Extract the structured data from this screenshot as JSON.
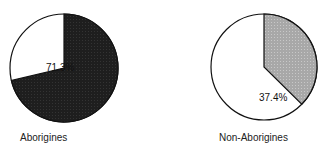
{
  "chart_data": [
    {
      "type": "pie",
      "title": "Aborigines",
      "categories": [
        "Shaded",
        "Unshaded"
      ],
      "values": [
        71.3,
        28.7
      ],
      "annotations": [
        "71.3%"
      ],
      "colors": [
        "#1c1c1c",
        "#ffffff"
      ]
    },
    {
      "type": "pie",
      "title": "Non-Aborigines",
      "categories": [
        "Shaded",
        "Unshaded"
      ],
      "values": [
        37.4,
        62.6
      ],
      "annotations": [
        "37.4%"
      ],
      "colors": [
        "#b0b0b0",
        "#ffffff"
      ]
    }
  ],
  "pies": [
    {
      "label": "Aborigines",
      "pct_label": "71.3%"
    },
    {
      "label": "Non-Aborigines",
      "pct_label": "37.4%"
    }
  ]
}
